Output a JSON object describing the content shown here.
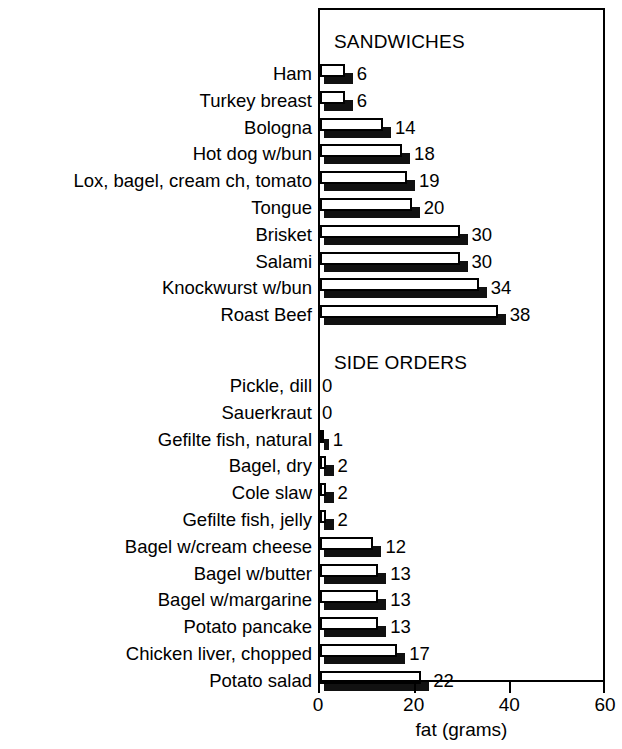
{
  "chart_data": {
    "type": "bar",
    "orientation": "horizontal",
    "title": "",
    "xlabel": "fat (grams)",
    "ylabel": "",
    "xlim": [
      0,
      60
    ],
    "xticks": [
      0,
      20,
      40,
      60
    ],
    "xtick_labels": [
      "0",
      "20",
      "40",
      "60"
    ],
    "grid": false,
    "legend": false,
    "value_labels": true,
    "sections": [
      {
        "name": "SANDWICHES",
        "categories": [
          "Ham",
          "Turkey breast",
          "Bologna",
          "Hot dog w/bun",
          "Lox, bagel, cream ch, tomato",
          "Tongue",
          "Brisket",
          "Salami",
          "Knockwurst w/bun",
          "Roast Beef"
        ],
        "values": [
          6,
          6,
          14,
          18,
          19,
          20,
          30,
          30,
          34,
          38
        ]
      },
      {
        "name": "SIDE ORDERS",
        "categories": [
          "Pickle, dill",
          "Sauerkraut",
          "Gefilte fish, natural",
          "Bagel, dry",
          "Cole slaw",
          "Gefilte fish, jelly",
          "Bagel w/cream cheese",
          "Bagel w/butter",
          "Bagel w/margarine",
          "Potato pancake",
          "Chicken liver, chopped",
          "Potato salad"
        ],
        "values": [
          0,
          0,
          1,
          2,
          2,
          2,
          12,
          13,
          13,
          13,
          17,
          22
        ]
      }
    ],
    "colors": {
      "bar_face": "#ffffff",
      "bar_outline": "#000000",
      "bar_shadow": "#111111",
      "axis": "#000000",
      "text": "#000000",
      "background": "#ffffff"
    }
  }
}
